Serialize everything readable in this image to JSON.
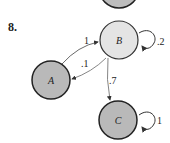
{
  "problem_number": "8.",
  "nodes": [
    {
      "id": "top",
      "label": "",
      "fill": "#bdbdbd"
    },
    {
      "id": "B",
      "label": "B",
      "fill": "#e4e4e4"
    },
    {
      "id": "A",
      "label": "A",
      "fill": "#b9b9b9"
    },
    {
      "id": "C",
      "label": "C",
      "fill": "#b9b9b9"
    }
  ],
  "edges": [
    {
      "from": "A",
      "to": "B",
      "label": "1"
    },
    {
      "from": "B",
      "to": "A",
      "label": ".1"
    },
    {
      "from": "B",
      "to": "C",
      "label": ".7"
    },
    {
      "from": "B",
      "to": "B",
      "label": ".2"
    },
    {
      "from": "C",
      "to": "C",
      "label": "1"
    }
  ]
}
